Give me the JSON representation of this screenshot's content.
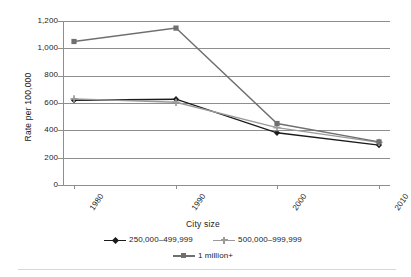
{
  "chart_data": {
    "type": "line",
    "title": "",
    "xlabel": "City size",
    "ylabel": "Rate per 100,000",
    "categories": [
      "1980",
      "1990",
      "2000",
      "2010"
    ],
    "ylim": [
      0,
      1200
    ],
    "yticks": [
      "0",
      "200",
      "400",
      "600",
      "800",
      "1,000",
      "1,200"
    ],
    "ytick_values": [
      0,
      200,
      400,
      600,
      800,
      1000,
      1200
    ],
    "grid": true,
    "legend_position": "bottom",
    "series": [
      {
        "name": "250,000–499,999",
        "marker": "diamond",
        "color": "#1b1b1b",
        "values": [
          620,
          628,
          382,
          292
        ]
      },
      {
        "name": "500,000–999,999",
        "marker": "plus",
        "color": "#9a9a9a",
        "values": [
          630,
          605,
          420,
          312
        ]
      },
      {
        "name": "1 million+",
        "marker": "square",
        "color": "#6f6f6f",
        "values": [
          1050,
          1148,
          450,
          315
        ]
      }
    ]
  },
  "colors": {
    "axis": "#8e8e8e",
    "grid": "#8e8e8e",
    "text": "#222222",
    "series_small": "#1b1b1b",
    "series_medium": "#9a9a9a",
    "series_large": "#6f6f6f",
    "background": "#ffffff"
  }
}
